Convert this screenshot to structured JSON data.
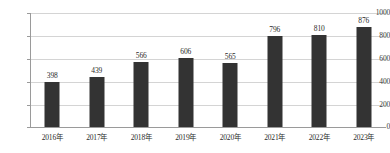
{
  "chart_data": {
    "type": "bar",
    "title": "",
    "subtitle": "",
    "xlabel": "",
    "ylabel": "",
    "categories": [
      "2016年",
      "2017年",
      "2018年",
      "2019年",
      "2020年",
      "2021年",
      "2022年",
      "2023年"
    ],
    "values": [
      398,
      439,
      566,
      606,
      565,
      796,
      810,
      876
    ],
    "data_labels": [
      "398",
      "439",
      "566",
      "606",
      "565",
      "796",
      "810",
      "876"
    ],
    "ylim": [
      0,
      1000
    ],
    "y_ticks": [
      0,
      200,
      400,
      600,
      800,
      1000
    ],
    "y_tick_labels": [
      "0",
      "200",
      "400",
      "600",
      "800",
      "1000"
    ],
    "grid": true,
    "grid_axis": "y",
    "legend": false,
    "legend_position": "none",
    "series": [
      {
        "name": "",
        "values": [
          398,
          439,
          566,
          606,
          565,
          796,
          810,
          876
        ]
      }
    ],
    "colors": {
      "bar": "#333333",
      "gridline": "#d4d4d4",
      "axis": "#9a9a9a",
      "background": "#ffffff",
      "label_text": "#2b2b2b"
    }
  }
}
